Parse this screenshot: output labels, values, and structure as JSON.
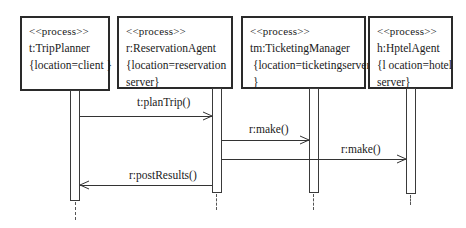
{
  "objects": [
    {
      "stereotype": "<<process>>",
      "name": "t:TripPlanner",
      "props": [
        "{location=client }"
      ]
    },
    {
      "stereotype": "<<process>>",
      "name": "r:ReservationAgent",
      "props": [
        "{location=reservation",
        "server}"
      ]
    },
    {
      "stereotype": "<<process>>",
      "name": "tm:TicketingManager",
      "props": [
        " {location=ticketingserver",
        " }"
      ]
    },
    {
      "stereotype": "<<process>>",
      "name": "h:HptelAgent",
      "props": [
        "{l ocation=hotel",
        "server}"
      ]
    }
  ],
  "messages": [
    {
      "label": "t:planTrip()",
      "from": "t:TripPlanner",
      "to": "r:ReservationAgent"
    },
    {
      "label": "r:make()",
      "from": "r:ReservationAgent",
      "to": "tm:TicketingManager"
    },
    {
      "label": "r:make()",
      "from": "r:ReservationAgent",
      "to": "h:HptelAgent"
    },
    {
      "label": "r:postResults()",
      "from": "r:ReservationAgent",
      "to": "t:TripPlanner"
    }
  ],
  "colors": {
    "line": "#2a2a2a",
    "background": "#ffffff"
  }
}
